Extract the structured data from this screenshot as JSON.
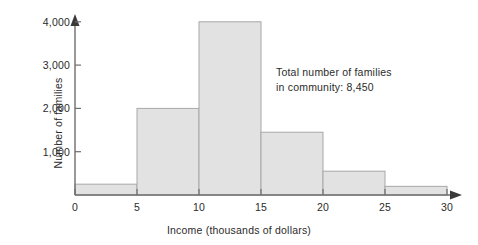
{
  "chart_data": {
    "type": "bar",
    "title": "",
    "subtitle": "",
    "xlabel": "Income (thousands of dollars)",
    "ylabel": "Number of families",
    "categories": [
      "0-5",
      "5-10",
      "10-15",
      "15-20",
      "20-25",
      "25-30"
    ],
    "bin_edges": [
      0,
      5,
      10,
      15,
      20,
      25,
      30
    ],
    "values": [
      250,
      2000,
      4000,
      1450,
      550,
      200
    ],
    "xlim": [
      0,
      30
    ],
    "ylim": [
      0,
      4300
    ],
    "x_ticks": [
      0,
      5,
      10,
      15,
      20,
      25,
      30
    ],
    "x_tick_labels": [
      "0",
      "5",
      "10",
      "15",
      "20",
      "25",
      "30"
    ],
    "y_ticks": [
      1000,
      2000,
      3000,
      4000
    ],
    "y_tick_labels": [
      "1,000",
      "2,000",
      "3,000",
      "4,000"
    ],
    "grid": false,
    "legend": null,
    "annotations": [
      {
        "line1": "Total number of families",
        "line2": "in community: 8,450"
      }
    ],
    "colors": {
      "bar_fill": "#e2e2e2",
      "bar_stroke": "#a8a8a8",
      "axis": "#6e6e6e",
      "text": "#2b2b2b",
      "background": "#ffffff"
    }
  },
  "axes": {
    "y_title": "Number of families",
    "x_title": "Income (thousands of dollars)",
    "y_tick_labels": [
      "4,000",
      "3,000",
      "2,000",
      "1,000"
    ],
    "x_tick_labels": [
      "0",
      "5",
      "10",
      "15",
      "20",
      "25",
      "30"
    ]
  },
  "annotation": {
    "line1": "Total number of families",
    "line2": "in community: 8,450",
    "total_families": "8,450"
  }
}
